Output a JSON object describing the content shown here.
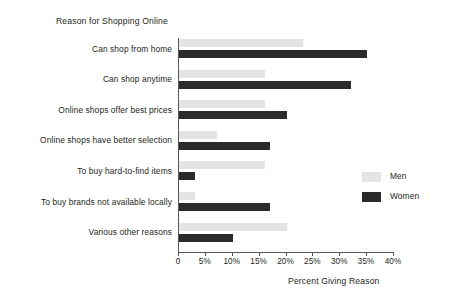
{
  "chart_data": {
    "type": "bar",
    "orientation": "horizontal",
    "title": "Reason for Shopping Online",
    "xlabel": "Percent Giving Reason",
    "ylabel": "",
    "xlim": [
      0,
      40
    ],
    "grid": false,
    "legend_position": "right",
    "tick_labels": [
      "0",
      "5%",
      "10%",
      "15%",
      "20%",
      "25%",
      "30%",
      "35%",
      "40%"
    ],
    "tick_values": [
      0,
      5,
      10,
      15,
      20,
      25,
      30,
      35,
      40
    ],
    "categories": [
      "Can shop from home",
      "Can shop anytime",
      "Online shops offer best prices",
      "Online shops have better selection",
      "To buy hard-to-find items",
      "To buy brands not available locally",
      "Various other reasons"
    ],
    "series": [
      {
        "name": "Men",
        "color": "#e4e4e4",
        "values": [
          23,
          16,
          16,
          7,
          16,
          3,
          20
        ]
      },
      {
        "name": "Women",
        "color": "#2b2b2b",
        "values": [
          35,
          32,
          20,
          17,
          3,
          17,
          10
        ]
      }
    ]
  }
}
